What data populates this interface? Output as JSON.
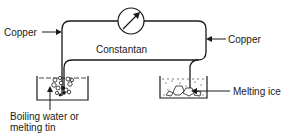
{
  "diagram": {
    "type": "thermocouple circuit",
    "labels": {
      "copper_left": "Copper",
      "copper_right": "Copper",
      "constantan": "Constantan",
      "hot_junction_line1": "Boiling water or",
      "hot_junction_line2": "melting tin",
      "cold_junction": "Melting ice"
    },
    "components": {
      "meter": "galvanometer",
      "hot_bath": "beaker of boiling water or melting tin",
      "cold_bath": "beaker of melting ice"
    },
    "colors": {
      "line": "#1a1a1a",
      "background": "#ffffff"
    }
  }
}
